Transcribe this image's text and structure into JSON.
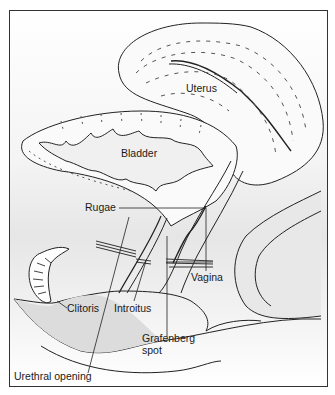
{
  "diagram": {
    "type": "anatomical-illustration",
    "view": "sagittal section",
    "labels": {
      "uterus": "Uterus",
      "bladder": "Bladder",
      "rugae": "Rugae",
      "vagina": "Vagina",
      "clitoris": "Clitoris",
      "introitus": "Introitus",
      "grafenberg_line1": "Grafenberg",
      "grafenberg_line2": "spot",
      "urethral_opening": "Urethral opening"
    },
    "colors": {
      "line": "#222222",
      "shade": "#d9d9d9",
      "background": "#ffffff"
    }
  }
}
